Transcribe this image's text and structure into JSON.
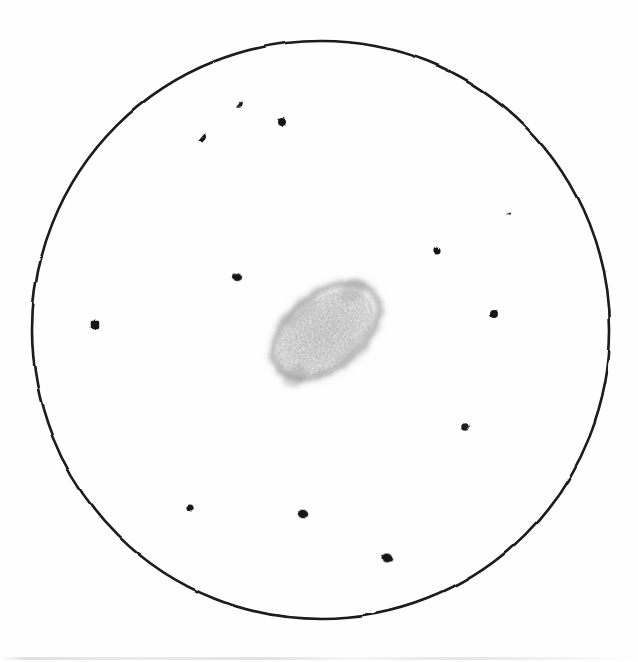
{
  "image": {
    "kind": "astronomical-eyepiece-sketch",
    "medium": "graphite pencil on white paper",
    "width": 638,
    "height": 662,
    "background_color": "#fefefe",
    "ink_color": "#1b1b1b",
    "nebula_color": "#a9a9a9"
  },
  "field_of_view": {
    "name": "eyepiece-field-circle",
    "shape": "circle",
    "center_x": 321,
    "center_y": 330,
    "radius": 289,
    "stroke_color": "#141414",
    "stroke_width": 2.6
  },
  "deep_sky_object": {
    "name": "galaxy-smudge",
    "type": "elliptical-nebulosity",
    "center_x": 326,
    "center_y": 331,
    "semi_major": 63,
    "semi_minor": 39,
    "rotation_deg": -39,
    "core_tone": "#b3b3b3",
    "halo_tone": "#c9c9c9",
    "rim_tone": "#8f8f8f"
  },
  "stars": [
    {
      "id": "star-1",
      "x": 240,
      "y": 104,
      "r": 3.6,
      "shape": "teardrop",
      "tone": "#1a1a1a"
    },
    {
      "id": "star-2",
      "x": 282,
      "y": 122,
      "r": 4.0,
      "shape": "round",
      "tone": "#171717"
    },
    {
      "id": "star-3",
      "x": 203,
      "y": 137,
      "r": 4.1,
      "shape": "teardrop",
      "tone": "#181818"
    },
    {
      "id": "star-4",
      "x": 509,
      "y": 214,
      "r": 2.1,
      "shape": "dash",
      "tone": "#3d3d3d"
    },
    {
      "id": "star-5",
      "x": 437,
      "y": 251,
      "r": 3.6,
      "shape": "round",
      "tone": "#191919"
    },
    {
      "id": "star-6",
      "x": 237,
      "y": 277,
      "r": 4.6,
      "shape": "blob",
      "tone": "#151515"
    },
    {
      "id": "star-7",
      "x": 95,
      "y": 325,
      "r": 4.2,
      "shape": "square",
      "tone": "#161616"
    },
    {
      "id": "star-8",
      "x": 494,
      "y": 314,
      "r": 4.0,
      "shape": "round",
      "tone": "#171717"
    },
    {
      "id": "star-9",
      "x": 465,
      "y": 427,
      "r": 3.7,
      "shape": "round",
      "tone": "#1a1a1a"
    },
    {
      "id": "star-10",
      "x": 190,
      "y": 508,
      "r": 3.6,
      "shape": "round",
      "tone": "#191919"
    },
    {
      "id": "star-11",
      "x": 303,
      "y": 514,
      "r": 4.7,
      "shape": "blob",
      "tone": "#141414"
    },
    {
      "id": "star-12",
      "x": 387,
      "y": 558,
      "r": 5.0,
      "shape": "blob",
      "tone": "#131313"
    }
  ],
  "scan_artifact": {
    "name": "scanner-edge-line",
    "y": 657,
    "visible": true
  }
}
